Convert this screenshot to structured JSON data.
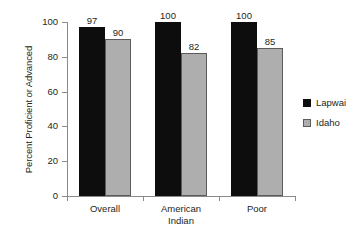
{
  "chart_data": {
    "type": "bar",
    "title": "",
    "subtitle": "",
    "xlabel": "",
    "ylabel": "Percent Proficient or Advanced",
    "categories": [
      "Overall",
      "American Indian",
      "Poor"
    ],
    "category_lines": [
      [
        "Overall"
      ],
      [
        "American",
        "Indian"
      ],
      [
        "Poor"
      ]
    ],
    "series": [
      {
        "name": "Lapwai",
        "color": "#0d0d0d",
        "values": [
          97,
          100,
          100
        ]
      },
      {
        "name": "Idaho",
        "color": "#aeaeae",
        "values": [
          90,
          82,
          85
        ]
      }
    ],
    "ylim": [
      0,
      100
    ],
    "yticks": [
      0,
      20,
      40,
      60,
      80,
      100
    ],
    "ytick_labels": [
      "0",
      "20",
      "40",
      "60",
      "80",
      "100"
    ],
    "grid": false,
    "legend_position": "right",
    "value_labels": [
      [
        "97",
        "90"
      ],
      [
        "100",
        "82"
      ],
      [
        "100",
        "85"
      ]
    ]
  },
  "legend": {
    "entries": [
      {
        "label": "Lapwai"
      },
      {
        "label": "Idaho"
      }
    ]
  },
  "axis": {
    "y_title": "Percent Proficient or Advanced"
  }
}
